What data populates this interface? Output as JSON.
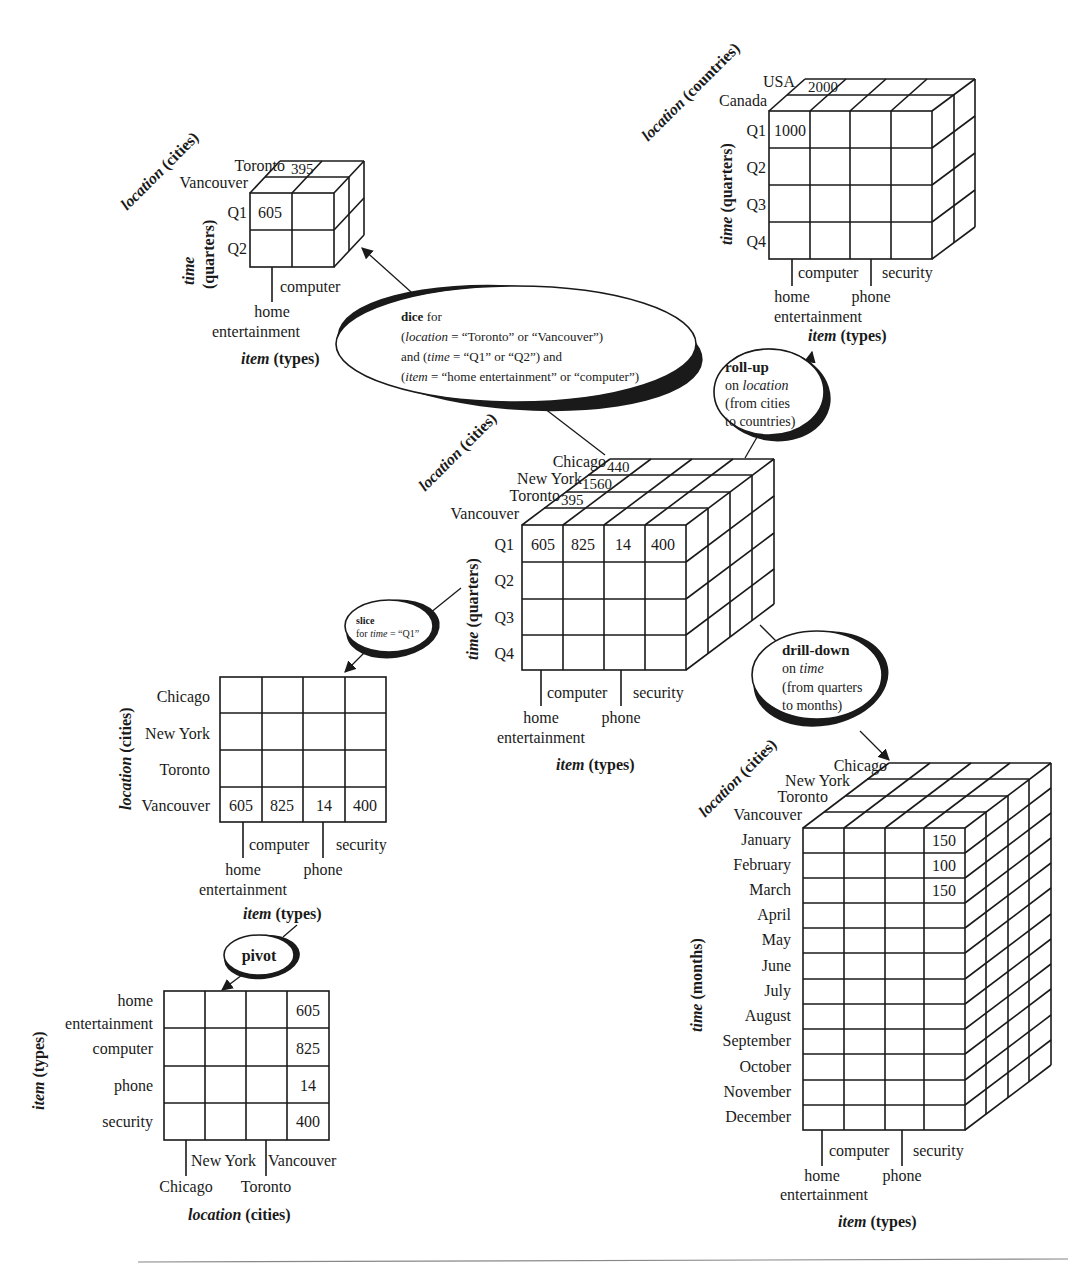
{
  "cubes": {
    "central": {
      "location_label": "location",
      "location_unit": "(cities)",
      "time_label": "time",
      "time_unit": "(quarters)",
      "item_label": "item",
      "item_unit": "(types)",
      "locations": [
        "Chicago",
        "New York",
        "Toronto",
        "Vancouver"
      ],
      "location_values": [
        "440",
        "1560",
        "395"
      ],
      "times": [
        "Q1",
        "Q2",
        "Q3",
        "Q4"
      ],
      "items_top": [
        "computer",
        "security"
      ],
      "items_bottom": [
        "home",
        "entertainment",
        "phone"
      ],
      "q1_values": [
        "605",
        "825",
        "14",
        "400"
      ]
    },
    "dice": {
      "location_label": "location",
      "location_unit": "(cities)",
      "time_label": "time",
      "time_unit": "(quarters)",
      "item_label": "item",
      "item_unit": "(types)",
      "locations": [
        "Toronto",
        "Vancouver"
      ],
      "location_value": "395",
      "times": [
        "Q1",
        "Q2"
      ],
      "q1_value": "605",
      "item_top": "computer",
      "item_bottom": [
        "home",
        "entertainment"
      ]
    },
    "rollup": {
      "location_label": "location",
      "location_unit": "(countries)",
      "time_label": "time",
      "time_unit": "(quarters)",
      "item_label": "item",
      "item_unit": "(types)",
      "locations": [
        "USA",
        "Canada"
      ],
      "location_value": "2000",
      "times": [
        "Q1",
        "Q2",
        "Q3",
        "Q4"
      ],
      "q1_value": "1000",
      "items_top": [
        "computer",
        "security"
      ],
      "items_bottom": [
        "home",
        "entertainment",
        "phone"
      ]
    },
    "drilldown": {
      "location_label": "location",
      "location_unit": "(cities)",
      "time_label": "time",
      "time_unit": "(months)",
      "item_label": "item",
      "item_unit": "(types)",
      "locations": [
        "Chicago",
        "New York",
        "Toronto",
        "Vancouver"
      ],
      "months": [
        "January",
        "February",
        "March",
        "April",
        "May",
        "June",
        "July",
        "August",
        "September",
        "October",
        "November",
        "December"
      ],
      "security_values": [
        "150",
        "100",
        "150"
      ],
      "items_top": [
        "computer",
        "security"
      ],
      "items_bottom": [
        "home",
        "entertainment",
        "phone"
      ]
    }
  },
  "tables": {
    "slice": {
      "location_label": "location",
      "location_unit": "(cities)",
      "item_label": "item",
      "item_unit": "(types)",
      "rows": [
        "Chicago",
        "New York",
        "Toronto",
        "Vancouver"
      ],
      "vancouver_values": [
        "605",
        "825",
        "14",
        "400"
      ],
      "items_top": [
        "computer",
        "security"
      ],
      "items_bottom": [
        "home",
        "entertainment",
        "phone"
      ]
    },
    "pivot": {
      "item_label": "item",
      "item_unit": "(types)",
      "location_label": "location",
      "location_unit": "(cities)",
      "rows": [
        "home",
        "entertainment",
        "computer",
        "phone",
        "security"
      ],
      "vancouver_values": [
        "605",
        "825",
        "14",
        "400"
      ],
      "cols_top": [
        "New York",
        "Vancouver"
      ],
      "cols_bottom": [
        "Chicago",
        "Toronto"
      ]
    }
  },
  "operations": {
    "dice": {
      "title": "dice",
      "line1_suffix": " for",
      "line2": [
        "(",
        "location",
        " = “Toronto” or “Vancouver”)"
      ],
      "line3": [
        "and (",
        "time",
        " = “Q1” or “Q2”) and"
      ],
      "line4": [
        "(",
        "item",
        " = “home entertainment” or “computer”)"
      ]
    },
    "rollup": {
      "title": "roll-up",
      "line2": [
        "on ",
        "location"
      ],
      "line3": "(from cities",
      "line4": "to countries)"
    },
    "slice": {
      "title": "slice",
      "line2": [
        "for ",
        "time",
        " = “Q1”"
      ]
    },
    "drilldown": {
      "title": "drill-down",
      "line2": [
        "on ",
        "time"
      ],
      "line3": "(from quarters",
      "line4": "to months)"
    },
    "pivot": {
      "title": "pivot"
    }
  }
}
